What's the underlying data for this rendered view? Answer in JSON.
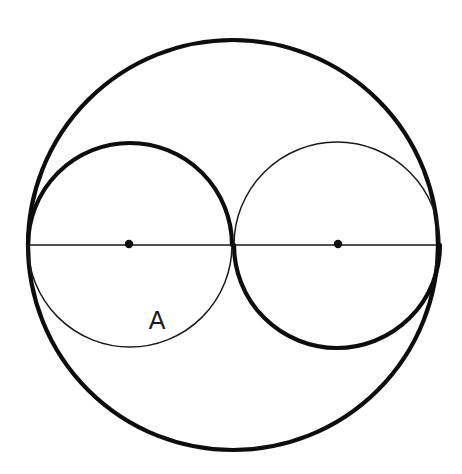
{
  "figure": {
    "kind": "geometry-diagram",
    "background_color": "#ffffff",
    "stroke_color": "#0d0d0d",
    "thin_stroke_color": "#1a1a1a",
    "bold_stroke_width": 4.2,
    "thin_stroke_width": 1.5,
    "canvas": {
      "width": 462,
      "height": 474
    }
  },
  "labels": [
    {
      "name": "region-label-A",
      "text": "A",
      "x": 157,
      "y": 329,
      "font_size": 25,
      "color": "#1a1a1a"
    }
  ],
  "shapes": {
    "outer_circle": {
      "name": "outer-circle",
      "cx": 233,
      "cy": 245,
      "r": 205,
      "weight": "bold",
      "color": "#0d0d0d"
    },
    "left_circle": {
      "name": "left-inner-circle",
      "cx": 130,
      "cy": 245,
      "r": 102,
      "upper_arc_weight": "bold",
      "lower_arc_weight": "thin",
      "color": "#0d0d0d"
    },
    "right_circle": {
      "name": "right-inner-circle",
      "cx": 337,
      "cy": 245,
      "r": 103,
      "upper_arc_weight": "thin",
      "lower_arc_weight": "bold",
      "color": "#0d0d0d"
    },
    "diameter_line": {
      "name": "horizontal-diameter-line",
      "x1": 28,
      "y1": 245,
      "x2": 440,
      "y2": 245,
      "weight": "thin",
      "color": "#141414"
    },
    "tangency_point": {
      "name": "tangency-point",
      "x": 233,
      "y": 245
    }
  },
  "center_dots": [
    {
      "name": "left-circle-center-dot",
      "cx": 129,
      "cy": 244,
      "r": 4.2,
      "color": "#0d0d0d"
    },
    {
      "name": "right-circle-center-dot",
      "cx": 338,
      "cy": 244,
      "r": 4.2,
      "color": "#0d0d0d"
    }
  ]
}
